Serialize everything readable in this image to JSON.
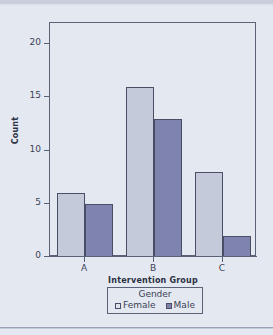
{
  "chart_data": {
    "type": "bar",
    "title": "",
    "subtitle": "",
    "xlabel": "Intervention Group",
    "ylabel": "Count",
    "categories": [
      "A",
      "B",
      "C"
    ],
    "series": [
      {
        "name": "Female",
        "values": [
          6,
          16,
          8
        ],
        "color": "#c5cadb"
      },
      {
        "name": "Male",
        "values": [
          5,
          13,
          2
        ],
        "color": "#7e84ae"
      }
    ],
    "ylim": [
      0,
      22
    ],
    "yticks": [
      0,
      5,
      10,
      15,
      20
    ],
    "ytick_labels": [
      "0",
      "5",
      "10",
      "15",
      "20"
    ],
    "grid": false,
    "legend": {
      "title": "Gender",
      "position": "bottom",
      "entries": [
        "Female",
        "Male"
      ]
    },
    "bar_edge_color": "#474e66",
    "background_color": "#e4e8f0",
    "axis_color": "#5a627a"
  },
  "axes": {
    "y_title": "Count",
    "x_title": "Intervention Group",
    "y_labels": [
      "20",
      "15",
      "10",
      "5",
      "0"
    ],
    "x_labels": [
      "A",
      "B",
      "C"
    ]
  },
  "legend": {
    "title": "Gender",
    "female_label": "Female",
    "male_label": "Male"
  }
}
